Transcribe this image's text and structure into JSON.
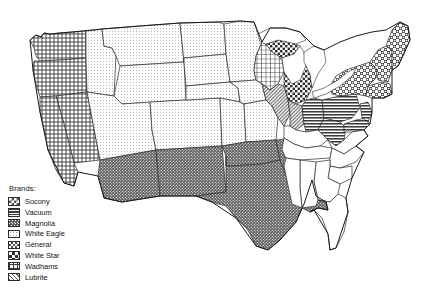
{
  "figure": {
    "type": "choropleth-pattern-map",
    "region": "United States (contiguous 48 states)",
    "background_color": "#ffffff",
    "outline_color": "#2b2b2b"
  },
  "legend": {
    "title": "Brands:",
    "items": [
      {
        "label": "Socony",
        "pattern": "open-diamond-checker",
        "swatch": "socony-swatch"
      },
      {
        "label": "Vacuum",
        "pattern": "horizontal-lines",
        "swatch": "vacuum-swatch"
      },
      {
        "label": "Magnolia",
        "pattern": "dense-dark-dots",
        "swatch": "magnolia-swatch"
      },
      {
        "label": "White Eagle",
        "pattern": "fine-light-dots",
        "swatch": "white-eagle-swatch"
      },
      {
        "label": "General",
        "pattern": "dense-diamond-grid",
        "swatch": "general-swatch"
      },
      {
        "label": "White Star",
        "pattern": "bold-checker",
        "swatch": "white-star-swatch"
      },
      {
        "label": "Wadhams",
        "pattern": "square-grid",
        "swatch": "wadhams-swatch"
      },
      {
        "label": "Lubrite",
        "pattern": "diagonal-hatch",
        "swatch": "lubrite-swatch"
      }
    ]
  },
  "map_data": {
    "unassigned_fill": "none",
    "regions": [
      {
        "brand": "General",
        "states": [
          "Washington",
          "Oregon",
          "California",
          "Nevada"
        ]
      },
      {
        "brand": "White Eagle",
        "states": [
          "Idaho",
          "Montana",
          "Wyoming",
          "Utah",
          "Colorado",
          "North Dakota",
          "South Dakota",
          "Nebraska",
          "Kansas",
          "Minnesota",
          "Iowa",
          "Missouri"
        ]
      },
      {
        "brand": "Magnolia",
        "states": [
          "Arizona",
          "New Mexico",
          "Texas",
          "Oklahoma",
          "Arkansas",
          "Louisiana"
        ]
      },
      {
        "brand": "Wadhams",
        "states": [
          "Wisconsin"
        ]
      },
      {
        "brand": "White Star",
        "states": [
          "Michigan"
        ]
      },
      {
        "brand": "Lubrite",
        "states": [
          "Illinois",
          "Indiana"
        ]
      },
      {
        "brand": "Vacuum",
        "states": [
          "Ohio",
          "Pennsylvania",
          "West Virginia",
          "Maryland",
          "Delaware",
          "New Jersey"
        ]
      },
      {
        "brand": "Socony",
        "states": [
          "New York",
          "Vermont",
          "New Hampshire",
          "Maine",
          "Massachusetts",
          "Connecticut",
          "Rhode Island"
        ]
      },
      {
        "brand": "none",
        "states": [
          "Kentucky",
          "Tennessee",
          "Virginia",
          "North Carolina",
          "South Carolina",
          "Georgia",
          "Florida",
          "Alabama",
          "Mississippi"
        ]
      }
    ]
  }
}
